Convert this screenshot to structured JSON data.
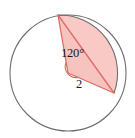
{
  "figure": {
    "type": "geometry-diagram",
    "background_color": "#ffffff",
    "circle": {
      "center_x": 68,
      "center_y": 73,
      "radius": 58,
      "stroke_color": "#6e6e6e",
      "stroke_width": 1.1,
      "fill": "none"
    },
    "shaded_region": {
      "name": "circular-segment-and-triangle",
      "fill_color": "#f9c9c5",
      "stroke_color": "#e06b62",
      "stroke_width": 1.3
    },
    "central_angle": {
      "value_degrees": 120,
      "label": "120°",
      "vertex_x": 68,
      "vertex_y": 73,
      "arc_marker_radius": 11,
      "arc_marker_color": "#e06b62"
    },
    "radii": [
      {
        "name": "radius-upper-left",
        "from_x": 68,
        "from_y": 73,
        "to_x": 58,
        "to_y": 15,
        "color": "#e06b62"
      },
      {
        "name": "radius-lower-right",
        "from_x": 68,
        "from_y": 73,
        "to_x": 114,
        "to_y": 93,
        "color": "#e06b62",
        "length_label": "2"
      }
    ],
    "chord": {
      "name": "chord",
      "from_x": 58,
      "from_y": 15,
      "to_x": 114,
      "to_y": 93,
      "color": "#e06b62"
    },
    "labels": {
      "angle": "120°",
      "radius": "2"
    }
  }
}
